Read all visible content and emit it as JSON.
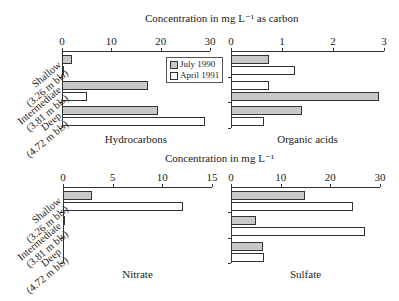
{
  "header_top": "Concentration in mg L⁻¹ as carbon",
  "header_bottom": "Concentration in mg L⁻¹",
  "legend": {
    "items": [
      {
        "label": "July 1990",
        "color": "#c8c8c8"
      },
      {
        "label": "April 1991",
        "color": "#ffffff"
      }
    ]
  },
  "categories": [
    {
      "name": "Shallow",
      "depth": "(3.26 m bls)"
    },
    {
      "name": "Intermediate",
      "depth": "(3.81 m bls)"
    },
    {
      "name": "Deep",
      "depth": "(4.72 m bls)"
    }
  ],
  "panels": [
    {
      "title": "Hydrocarbons",
      "ticks": [
        "0",
        "10",
        "20",
        "30"
      ]
    },
    {
      "title": "Organic acids",
      "ticks": [
        "0",
        "1",
        "2",
        "3"
      ]
    },
    {
      "title": "Nitrate",
      "ticks": [
        "0",
        "5",
        "10",
        "15"
      ]
    },
    {
      "title": "Sulfate",
      "ticks": [
        "0",
        "10",
        "20",
        "30"
      ]
    }
  ],
  "chart_data": [
    {
      "type": "bar",
      "orientation": "horizontal",
      "title": "Hydrocarbons",
      "xlabel": "Concentration in mg L⁻¹ as carbon",
      "categories": [
        "Shallow (3.26 m bls)",
        "Intermediate (3.81 m bls)",
        "Deep (4.72 m bls)"
      ],
      "series": [
        {
          "name": "July 1990",
          "values": [
            2,
            17.5,
            19.5
          ]
        },
        {
          "name": "April 1991",
          "values": [
            0.2,
            5,
            29
          ]
        }
      ],
      "xlim": [
        0,
        30
      ]
    },
    {
      "type": "bar",
      "orientation": "horizontal",
      "title": "Organic acids",
      "xlabel": "Concentration in mg L⁻¹ as carbon",
      "categories": [
        "Shallow (3.26 m bls)",
        "Intermediate (3.81 m bls)",
        "Deep (4.72 m bls)"
      ],
      "series": [
        {
          "name": "July 1990",
          "values": [
            0.75,
            2.9,
            1.4
          ]
        },
        {
          "name": "April 1991",
          "values": [
            1.25,
            0.75,
            0.65
          ]
        }
      ],
      "xlim": [
        0,
        3
      ]
    },
    {
      "type": "bar",
      "orientation": "horizontal",
      "title": "Nitrate",
      "xlabel": "Concentration in mg L⁻¹",
      "categories": [
        "Shallow (3.26 m bls)",
        "Intermediate (3.81 m bls)",
        "Deep (4.72 m bls)"
      ],
      "series": [
        {
          "name": "July 1990",
          "values": [
            2.9,
            0.2,
            0
          ]
        },
        {
          "name": "April 1991",
          "values": [
            12.1,
            0,
            0
          ]
        }
      ],
      "xlim": [
        0,
        15
      ]
    },
    {
      "type": "bar",
      "orientation": "horizontal",
      "title": "Sulfate",
      "xlabel": "Concentration in mg L⁻¹",
      "categories": [
        "Shallow (3.26 m bls)",
        "Intermediate (3.81 m bls)",
        "Deep (4.72 m bls)"
      ],
      "series": [
        {
          "name": "July 1990",
          "values": [
            14.8,
            5,
            6.5
          ]
        },
        {
          "name": "April 1991",
          "values": [
            24.5,
            27,
            6.6
          ]
        }
      ],
      "xlim": [
        0,
        30
      ]
    }
  ]
}
